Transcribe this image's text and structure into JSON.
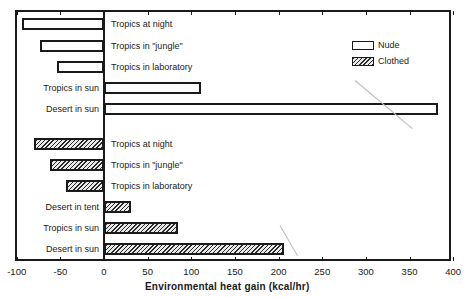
{
  "chart_data": {
    "type": "bar",
    "orientation": "horizontal",
    "title": "",
    "xlabel": "Environmental heat gain (kcal/hr)",
    "ylabel": "",
    "xlim": [
      -100,
      400
    ],
    "xticks": [
      -100,
      -50,
      0,
      50,
      100,
      150,
      200,
      250,
      300,
      350,
      400
    ],
    "grid": false,
    "legend": {
      "position": "upper right",
      "entries": [
        "Nude",
        "Clothed"
      ]
    },
    "series": [
      {
        "name": "Nude",
        "style": "open",
        "categories": [
          "Tropics at night",
          "Tropics in \"jungle\"",
          "Tropics in laboratory",
          "Tropics in sun",
          "Desert in sun"
        ],
        "values": [
          -94,
          -73,
          -54,
          111,
          383
        ]
      },
      {
        "name": "Clothed",
        "style": "hatched",
        "categories": [
          "Tropics at night",
          "Tropics in \"jungle\"",
          "Tropics in laboratory",
          "Desert in tent",
          "Tropics in sun",
          "Desert in sun"
        ],
        "values": [
          -80,
          -62,
          -44,
          31,
          85,
          206
        ]
      }
    ]
  },
  "labels": {
    "nude": [
      "Tropics at night",
      "Tropics in \"jungle\"",
      "Tropics in laboratory",
      "Tropics in sun",
      "Desert in sun"
    ],
    "clothed": [
      "Tropics at night",
      "Tropics in \"jungle\"",
      "Tropics in laboratory",
      "Desert in tent",
      "Tropics in sun",
      "Desert in sun"
    ]
  },
  "axis": {
    "xlabel": "Environmental heat gain (kcal/hr)",
    "ticks": [
      "-100",
      "-50",
      "0",
      "50",
      "100",
      "150",
      "200",
      "250",
      "300",
      "350",
      "400"
    ]
  },
  "legend": {
    "nude": "Nude",
    "clothed": "Clothed"
  }
}
